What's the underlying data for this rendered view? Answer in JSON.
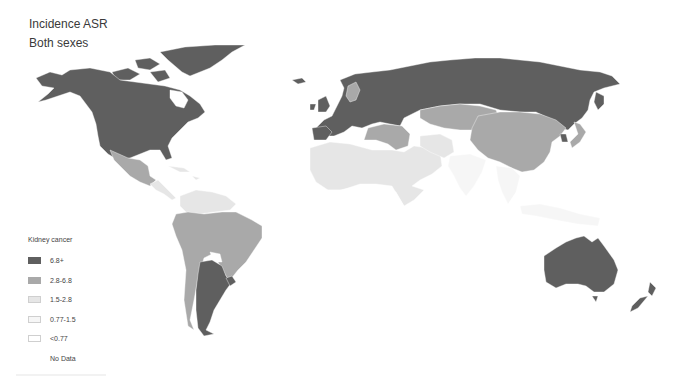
{
  "header": {
    "title": "Incidence ASR",
    "subtitle": "Both sexes"
  },
  "legend": {
    "title": "Kidney cancer",
    "items": [
      {
        "label": "6.8+",
        "color": "#5f5f5f"
      },
      {
        "label": "2.8-6.8",
        "color": "#a9a9a9"
      },
      {
        "label": "1.5-2.8",
        "color": "#e6e6e6"
      },
      {
        "label": "0.77-1.5",
        "color": "#f6f6f6"
      },
      {
        "label": "<0.77",
        "color": "#ffffff"
      },
      {
        "label": "No Data",
        "color": null
      }
    ]
  },
  "map": {
    "type": "choropleth",
    "measure": "Kidney cancer incidence ASR, both sexes",
    "regions": [
      {
        "name": "North America (USA, Canada)",
        "class": "6.8+"
      },
      {
        "name": "Greenland",
        "class": "6.8+"
      },
      {
        "name": "Mexico",
        "class": "2.8-6.8"
      },
      {
        "name": "Central America & Caribbean",
        "class": "1.5-2.8"
      },
      {
        "name": "Northern South America",
        "class": "1.5-2.8"
      },
      {
        "name": "Brazil / Peru / Bolivia / Chile",
        "class": "2.8-6.8"
      },
      {
        "name": "Argentina",
        "class": "6.8+"
      },
      {
        "name": "Uruguay",
        "class": "6.8+"
      },
      {
        "name": "Europe",
        "class": "6.8+"
      },
      {
        "name": "Sweden",
        "class": "2.8-6.8"
      },
      {
        "name": "Russia",
        "class": "6.8+"
      },
      {
        "name": "Kazakhstan / Central Asia",
        "class": "2.8-6.8"
      },
      {
        "name": "China / Mongolia",
        "class": "2.8-6.8"
      },
      {
        "name": "Japan",
        "class": "2.8-6.8"
      },
      {
        "name": "South Korea",
        "class": "6.8+"
      },
      {
        "name": "Turkey / Middle East",
        "class": "2.8-6.8"
      },
      {
        "name": "North Africa / Arabia",
        "class": "1.5-2.8"
      },
      {
        "name": "Sub-Saharan Africa",
        "class": "<0.77"
      },
      {
        "name": "South & Southeast Asia",
        "class": "0.77-1.5"
      },
      {
        "name": "Australia",
        "class": "6.8+"
      },
      {
        "name": "New Zealand",
        "class": "6.8+"
      }
    ]
  }
}
